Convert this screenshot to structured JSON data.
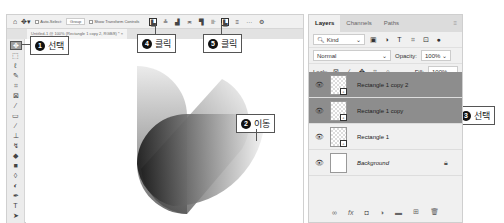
{
  "caption": "가운데 정렬하고 배치합니다.",
  "options_bar": {
    "home_icon": "home-icon",
    "move_icon": "move-icon",
    "auto_select_label": "Auto-Select:",
    "auto_select_value": "Group",
    "show_transform_label": "Show Transform Controls",
    "align_buttons": [
      "align-left-edges",
      "align-horizontal-centers",
      "align-right-edges",
      "distribute",
      "align-top-edges",
      "align-vertical-centers",
      "align-bottom-edges",
      "distribute-vertical",
      "more",
      "settings"
    ]
  },
  "document_tab": {
    "label": "Untitled-1 @ 100% (Rectangle 1 copy 2, RGB/8) *",
    "close": "×"
  },
  "tools": [
    "move",
    "marquee",
    "lasso",
    "quick-select",
    "crop",
    "frame",
    "eyedropper",
    "healing",
    "brush",
    "stamp",
    "history-brush",
    "eraser",
    "gradient",
    "blur",
    "dodge",
    "pen",
    "text",
    "path-select"
  ],
  "callouts": [
    {
      "num": "1",
      "text": "선택"
    },
    {
      "num": "2",
      "text": "이동"
    },
    {
      "num": "3",
      "text": "선택"
    },
    {
      "num": "4",
      "text": "클릭"
    },
    {
      "num": "5",
      "text": "클릭"
    }
  ],
  "layers_panel": {
    "tabs": [
      "Layers",
      "Channels",
      "Paths"
    ],
    "menu_icon": "≡",
    "filter": {
      "label": "Kind"
    },
    "blend_mode": "Normal",
    "opacity_label": "Opacity:",
    "opacity_value": "100%",
    "lock_label": "Lock:",
    "fill_label": "Fill:",
    "fill_value": "100%",
    "layers": [
      {
        "name": "Rectangle 1 copy 2",
        "selected": true,
        "type": "shape"
      },
      {
        "name": "Rectangle 1 copy",
        "selected": true,
        "type": "shape"
      },
      {
        "name": "Rectangle 1",
        "selected": false,
        "type": "shape"
      },
      {
        "name": "Background",
        "selected": false,
        "type": "background",
        "locked": true
      }
    ],
    "footer_icons": [
      "link-layers",
      "fx",
      "add-mask",
      "adjustment",
      "group",
      "new-layer",
      "delete"
    ]
  }
}
